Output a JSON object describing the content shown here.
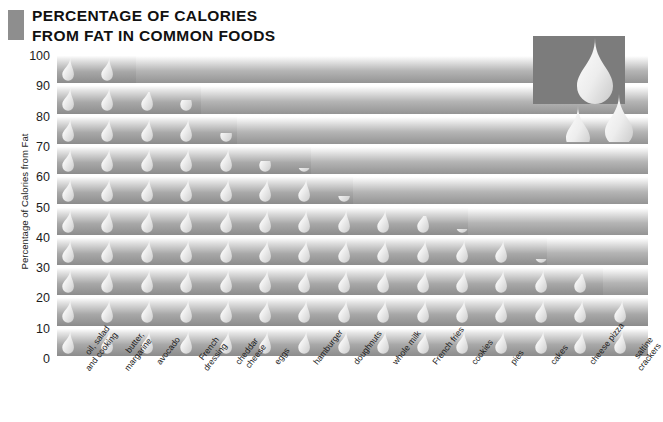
{
  "title": {
    "line1": "PERCENTAGE OF CALORIES",
    "line2": "FROM FAT IN COMMON FOODS",
    "full": "PERCENTAGE OF CALORIES\nFROM FAT IN COMMON FOODS",
    "accent_color": "#8e8e8e"
  },
  "logo": {
    "name": "fat-drops-logo",
    "block_color": "#7c7c7c",
    "drop_color": "#e8e8e8"
  },
  "chart_data": {
    "type": "bar",
    "title": "PERCENTAGE OF CALORIES FROM FAT IN COMMON FOODS",
    "xlabel": "",
    "ylabel": "Percentage of Calories from Fat",
    "ylim": [
      0,
      100
    ],
    "yticks": [
      0,
      10,
      20,
      30,
      40,
      50,
      60,
      70,
      80,
      90,
      100
    ],
    "ytick_labels": [
      "0",
      "10",
      "20",
      "30",
      "40",
      "50",
      "60",
      "70",
      "80",
      "90",
      "100"
    ],
    "grid": true,
    "legend": false,
    "bar_style": "pictogram-drop",
    "categories": [
      "oil, salad\nand cooking",
      "butter,\nmargarine",
      "avocado",
      "French\ndressing",
      "cheddar\ncheese",
      "eggs",
      "hamburger",
      "doughnuts",
      "whole milk",
      "French fries",
      "cookies",
      "pies",
      "cakes",
      "cheese pizza",
      "saltine\ncrackers"
    ],
    "values": [
      100,
      100,
      88,
      85,
      74,
      65,
      62,
      53,
      50,
      47,
      42,
      40,
      32,
      28,
      20
    ]
  }
}
